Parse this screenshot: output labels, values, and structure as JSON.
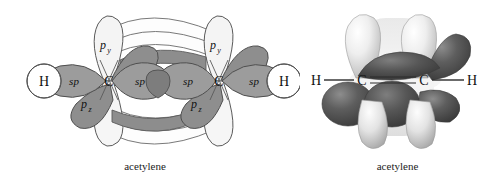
{
  "figure": {
    "panels": [
      {
        "id": "orbital-line-diagram",
        "caption": "acetylene",
        "molecule": "acetylene",
        "atom_labels": [
          "H",
          "C",
          "C",
          "H"
        ],
        "orbital_labels": {
          "sp": "sp",
          "py": "p",
          "py_sub": "y",
          "pz": "p",
          "pz_sub": "z"
        },
        "sp_labels": [
          "sp",
          "sp",
          "sp",
          "sp"
        ],
        "py_labels": [
          "p",
          "p"
        ],
        "py_subscripts": [
          "y",
          "y"
        ],
        "pz_labels": [
          "p",
          "p"
        ],
        "pz_subscripts": [
          "z",
          "z"
        ],
        "h_labels": [
          "H",
          "H"
        ],
        "c_labels": [
          "C",
          "C"
        ]
      },
      {
        "id": "space-filling-orbital-model",
        "caption": "acetylene",
        "molecule": "acetylene",
        "atom_labels": [
          "H",
          "C",
          "C",
          "H"
        ],
        "bond_type": "triple"
      }
    ]
  },
  "colors": {
    "background": "#ffffff",
    "outline": "#555555",
    "sp_fill": "#9a9a9a",
    "sp_overlap_fill": "#7c7c7c",
    "pz_fill": "#8e8e8e",
    "py_fill": "#f2f2f2",
    "pi_band_dark": "#8d8d8d",
    "pi_band_light": "#fcfcfc",
    "h_fill": "#ffffff",
    "model_dark_lobe": "#4a4a4a",
    "model_light_lobe": "#e6e6e6",
    "model_mid": "#9f9f9f",
    "text": "#1c1c1c"
  }
}
